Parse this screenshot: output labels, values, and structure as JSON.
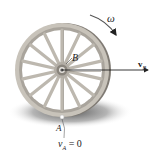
{
  "figure": {
    "labels": {
      "omega": "ω",
      "point_B": "B",
      "velocity_B_main": "v",
      "velocity_B_sub": "B",
      "point_A": "A",
      "velocity_A_main": "v",
      "velocity_A_sub": "A",
      "velocity_A_eq": " = 0"
    },
    "colors": {
      "rim": "#b5b0a8",
      "rim_dark": "#8c8780",
      "spoke": "#c9c4bb",
      "hub": "#9a958d",
      "shadow": "#5a5a5a",
      "arrow": "#222222"
    },
    "wheel": {
      "cx": 62,
      "cy": 70,
      "r_outer": 47,
      "r_inner": 40,
      "spokes": 14
    }
  }
}
